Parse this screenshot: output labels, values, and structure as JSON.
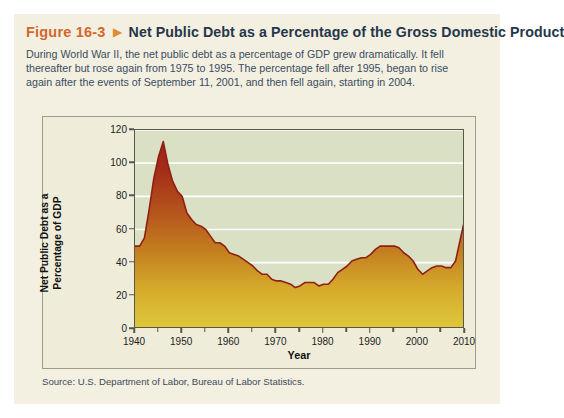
{
  "figure": {
    "number": "Figure 16-3",
    "triangle_icon": "triangle-right-icon",
    "title": "Net Public Debt as a Percentage of the Gross Domestic Product",
    "caption": "During World War II, the net public debt as a percentage of GDP grew dramatically. It fell thereafter but rose again from 1975 to 1995. The percentage fell after 1995, began to rise again after the events of September 11, 2001, and then fell again, starting in 2004.",
    "source": "Source: U.S. Department of Labor, Bureau of Labor Statistics."
  },
  "colors": {
    "figure_number": "#d2682c",
    "triangle": "#e08a33",
    "title": "#26364b",
    "caption": "#3a4c60",
    "card_background": "#f3f0e1",
    "panel_background": "#efecd9",
    "plot_background": "#d9e0c4",
    "gridline": "#ffffff",
    "axis": "#55584a",
    "area_top": "#9e2417",
    "area_bottom": "#e0c63a",
    "line": "#8f1f14"
  },
  "chart_data": {
    "type": "area",
    "title": "Net Public Debt as a Percentage of the Gross Domestic Product",
    "xlabel": "Year",
    "ylabel": "Net Public Debt as a Percentage of GDP",
    "xlim": [
      1940,
      2010
    ],
    "ylim": [
      0,
      120
    ],
    "grid": true,
    "legend": "none",
    "ytick_labels": [
      "0",
      "20",
      "40",
      "60",
      "80",
      "100",
      "120"
    ],
    "ytick_values": [
      0,
      20,
      40,
      60,
      80,
      100,
      120
    ],
    "xtick_labels": [
      "1940",
      "1950",
      "1960",
      "1970",
      "1980",
      "1990",
      "2000",
      "2010"
    ],
    "xtick_values": [
      1940,
      1950,
      1960,
      1970,
      1980,
      1990,
      2000,
      2010
    ],
    "xtick_minor": [
      1945,
      1955,
      1965,
      1975,
      1985,
      1995,
      2005
    ],
    "x": [
      1940,
      1941,
      1942,
      1943,
      1944,
      1945,
      1946,
      1947,
      1948,
      1949,
      1950,
      1951,
      1952,
      1953,
      1954,
      1955,
      1956,
      1957,
      1958,
      1959,
      1960,
      1961,
      1962,
      1963,
      1964,
      1965,
      1966,
      1967,
      1968,
      1969,
      1970,
      1971,
      1972,
      1973,
      1974,
      1975,
      1976,
      1977,
      1978,
      1979,
      1980,
      1981,
      1982,
      1983,
      1984,
      1985,
      1986,
      1987,
      1988,
      1989,
      1990,
      1991,
      1992,
      1993,
      1994,
      1995,
      1996,
      1997,
      1998,
      1999,
      2000,
      2001,
      2002,
      2003,
      2004,
      2005,
      2006,
      2007,
      2008,
      2009,
      2010
    ],
    "values": [
      50,
      50,
      55,
      72,
      91,
      104,
      113,
      99,
      89,
      83,
      80,
      70,
      66,
      63,
      62,
      60,
      56,
      52,
      52,
      50,
      46,
      45,
      44,
      42,
      40,
      38,
      35,
      33,
      33,
      30,
      29,
      29,
      28,
      27,
      25,
      26,
      28,
      28,
      28,
      26,
      27,
      27,
      30,
      34,
      36,
      38,
      41,
      42,
      43,
      43,
      45,
      48,
      50,
      50,
      50,
      50,
      49,
      46,
      44,
      41,
      36,
      33,
      35,
      37,
      38,
      38,
      37,
      37,
      41,
      54,
      67
    ],
    "annotations": []
  }
}
